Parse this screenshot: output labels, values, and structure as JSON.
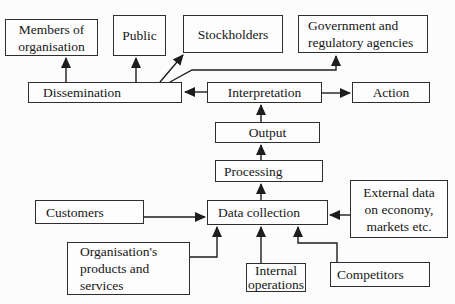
{
  "diagram": {
    "type": "flow-diagram",
    "colors": {
      "background": "#fcfcfc",
      "box_fill": "#fdfdfd",
      "box_border": "#2e2e2e",
      "line": "#1d1d1d",
      "text": "#161616"
    },
    "boxes": {
      "members": {
        "label": "Members of\norganisation"
      },
      "public": {
        "label": "Public"
      },
      "stockholders": {
        "label": "Stockholders"
      },
      "government": {
        "label": "Government and\nregulatory agencies"
      },
      "dissemination": {
        "label": "Dissemination"
      },
      "interpretation": {
        "label": "Interpretation"
      },
      "action": {
        "label": "Action"
      },
      "output": {
        "label": "Output"
      },
      "processing": {
        "label": "Processing"
      },
      "data_collection": {
        "label": "Data collection"
      },
      "customers": {
        "label": "Customers"
      },
      "org_products": {
        "label": "Organisation's\nproducts and\nservices"
      },
      "internal_operations": {
        "label": "Internal\noperations"
      },
      "competitors": {
        "label": "Competitors"
      },
      "external_data": {
        "label": "External data\non economy,\nmarkets etc."
      }
    },
    "edges": [
      {
        "from": "dissemination",
        "to": "members"
      },
      {
        "from": "dissemination",
        "to": "public"
      },
      {
        "from": "dissemination",
        "to": "stockholders"
      },
      {
        "from": "dissemination",
        "to": "government"
      },
      {
        "from": "interpretation",
        "to": "dissemination"
      },
      {
        "from": "interpretation",
        "to": "action"
      },
      {
        "from": "output",
        "to": "interpretation"
      },
      {
        "from": "processing",
        "to": "output"
      },
      {
        "from": "data_collection",
        "to": "processing"
      },
      {
        "from": "customers",
        "to": "data_collection"
      },
      {
        "from": "external_data",
        "to": "data_collection"
      },
      {
        "from": "org_products",
        "to": "data_collection"
      },
      {
        "from": "internal_operations",
        "to": "data_collection"
      },
      {
        "from": "competitors",
        "to": "data_collection"
      }
    ]
  }
}
